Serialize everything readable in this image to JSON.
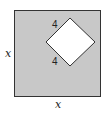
{
  "diagram": {
    "outer_square": {
      "side_label": "x",
      "left_label": "x",
      "bottom_label": "x",
      "fill": "#c8c8c8",
      "stroke": "#333333"
    },
    "inner_square": {
      "side_labels": [
        "4",
        "4"
      ],
      "fill": "#ffffff",
      "stroke": "#333333",
      "orientation": "rotated 45°"
    },
    "labels": {
      "left": "x",
      "bottom": "x",
      "upper_side": "4",
      "lower_side": "4"
    }
  }
}
